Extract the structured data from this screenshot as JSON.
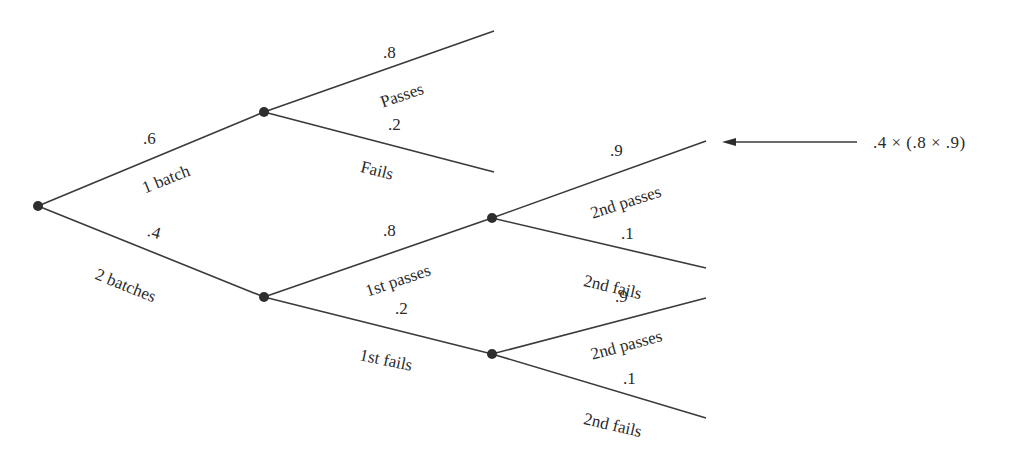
{
  "diagram": {
    "type": "probability-tree",
    "root": {
      "branches": [
        {
          "label": "1 batch",
          "probability": ".6",
          "children": [
            {
              "label": "Passes",
              "probability": ".8"
            },
            {
              "label": "Fails",
              "probability": ".2"
            }
          ]
        },
        {
          "label": "2 batches",
          "probability": ".4",
          "children": [
            {
              "label": "1st passes",
              "probability": ".8",
              "children": [
                {
                  "label": "2nd passes",
                  "probability": ".9"
                },
                {
                  "label": "2nd fails",
                  "probability": ".1"
                }
              ]
            },
            {
              "label": "1st fails",
              "probability": ".2",
              "children": [
                {
                  "label": "2nd passes",
                  "probability": ".9"
                },
                {
                  "label": "2nd fails",
                  "probability": ".1"
                }
              ]
            }
          ]
        }
      ]
    },
    "labels": {
      "b1_prob": ".6",
      "b1_label": "1 batch",
      "b2_prob": ".4",
      "b2_label": "2 batches",
      "b1_pass_prob": ".8",
      "b1_pass_label": "Passes",
      "b1_fail_prob": ".2",
      "b1_fail_label": "Fails",
      "b2_first_pass_prob": ".8",
      "b2_first_pass_label": "1st passes",
      "b2_first_fail_prob": ".2",
      "b2_first_fail_label": "1st fails",
      "fp_second_pass_prob": ".9",
      "fp_second_pass_label": "2nd passes",
      "fp_second_fail_prob": ".1",
      "fp_second_fail_label": "2nd fails",
      "ff_second_pass_prob": ".9",
      "ff_second_pass_label": "2nd passes",
      "ff_second_fail_prob": ".1",
      "ff_second_fail_label": "2nd fails"
    },
    "annotation": {
      "formula": ".4 × (.8 × .9)",
      "points_to": "2 batches → 1st passes → 2nd passes"
    },
    "colors": {
      "line": "#3a3a3a",
      "node": "#2e2e2e",
      "text": "#2a2a2a",
      "background": "#ffffff"
    }
  }
}
